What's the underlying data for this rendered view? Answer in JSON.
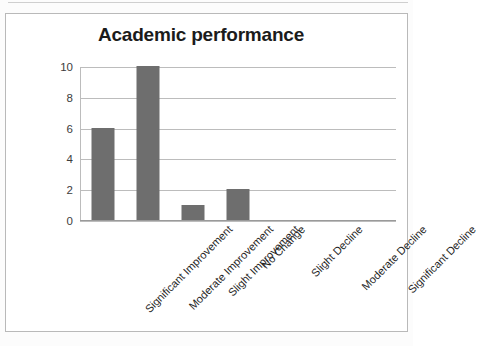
{
  "chart_data": {
    "type": "bar",
    "title": "Academic performance",
    "xlabel": "",
    "ylabel": "",
    "categories": [
      "Significant Improvement",
      "Moderate Improvement",
      "Slight Improvement",
      "No Change",
      "Slight Decline",
      "Moderate Decline",
      "Significant Decline"
    ],
    "values": [
      6,
      10,
      1,
      2,
      0,
      0,
      0
    ],
    "ylim": [
      0,
      10
    ],
    "yticks": [
      0,
      2,
      4,
      6,
      8,
      10
    ],
    "ytick_labels": [
      "0",
      "2",
      "4",
      "6",
      "8",
      "10"
    ],
    "grid": true,
    "legend": false,
    "bar_color": "#6e6e6e",
    "gridline_color": "#bcbcbc",
    "title_color": "#1b1b1b",
    "background": "#ffffff"
  }
}
